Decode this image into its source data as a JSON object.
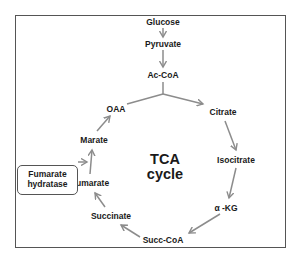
{
  "diagram": {
    "title": "TCA cycle",
    "center_label": {
      "line1": "TCA",
      "line2": "cycle"
    },
    "upstream": {
      "glucose": "Glucose",
      "pyruvate": "Pyruvate",
      "acetyl_coa": "Ac-CoA"
    },
    "cycle": {
      "oaa": "OAA",
      "citrate": "Citrate",
      "isocitrate": "Isocitrate",
      "alpha_kg": "α -KG",
      "succ_coa": "Succ-CoA",
      "succinate": "Succinate",
      "fumarate": "Fumarate",
      "marate": "Marate"
    },
    "enzyme": {
      "line1": "Fumarate",
      "line2": "hydratase",
      "acts_on": "Fumarate → Marate"
    },
    "colors": {
      "arrow": "#8c8c8c",
      "frame": "#555555",
      "text": "#1a1a1a"
    }
  }
}
